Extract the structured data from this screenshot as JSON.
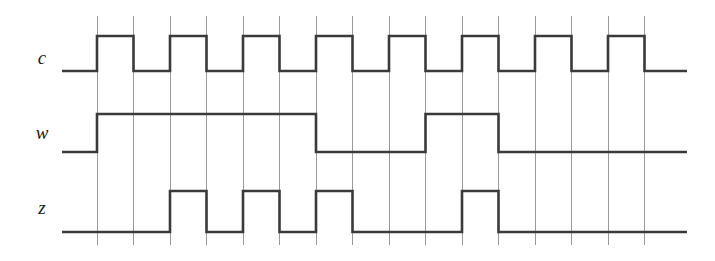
{
  "figure": {
    "type": "timing-diagram",
    "title": "",
    "background_color": "#ffffff",
    "waveform_color": "#3a3a3a",
    "gridline_color": "#9a9a9a"
  },
  "grid": {
    "line_count": 16,
    "first_x": 97,
    "spacing": 36.5,
    "top_y": 16,
    "bottom_y": 245,
    "cell_count": 15
  },
  "axis": {
    "wave_start_x": 62,
    "wave_end_x": 687
  },
  "chart_data": {
    "type": "line",
    "title": "",
    "xlabel": "",
    "ylabel": "",
    "grid": true,
    "legend": "none",
    "signals": [
      {
        "name": "c",
        "label": "c",
        "label_x": 42,
        "label_y": 60,
        "low_y": 71,
        "high_y": 36,
        "initial_level": 0,
        "description": "clock: toggles at every gridline",
        "levels": [
          1,
          0,
          1,
          0,
          1,
          0,
          1,
          0,
          1,
          0,
          1,
          0,
          1,
          0,
          1
        ],
        "tail_level": 0
      },
      {
        "name": "w",
        "label": "w",
        "label_x": 42,
        "label_y": 135,
        "low_y": 152,
        "high_y": 114,
        "initial_level": 0,
        "description": "w: high from grid 1 to grid 7, low, pulse from grid 10 to grid 12",
        "levels": [
          1,
          1,
          1,
          1,
          1,
          1,
          0,
          0,
          0,
          1,
          1,
          0,
          0,
          0,
          0
        ],
        "tail_level": 0
      },
      {
        "name": "z",
        "label": "z",
        "label_x": 42,
        "label_y": 210,
        "low_y": 232,
        "high_y": 191,
        "initial_level": 0,
        "description": "z: pulses on cells 3, 5, 7 then on cell 11",
        "levels": [
          0,
          0,
          1,
          0,
          1,
          0,
          1,
          0,
          0,
          0,
          1,
          0,
          0,
          0,
          0
        ],
        "tail_level": 0
      }
    ]
  }
}
